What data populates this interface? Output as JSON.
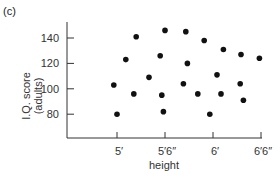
{
  "panel_label": "(c)",
  "chart_data": {
    "type": "scatter",
    "title": "",
    "xlabel": "height",
    "ylabel": "I.Q. score (adults)",
    "ylabel_lines": [
      "I.Q. score",
      "(adults)"
    ],
    "x_ticks": [
      {
        "label": "5′",
        "inches": 60
      },
      {
        "label": "5′6″",
        "inches": 66
      },
      {
        "label": "6′",
        "inches": 72
      },
      {
        "label": "6′6″",
        "inches": 78
      }
    ],
    "y_ticks": [
      80,
      100,
      120,
      140
    ],
    "xlim_inches": [
      53,
      79
    ],
    "ylim": [
      60,
      150
    ],
    "grid": false,
    "x_unit": "inches",
    "points": [
      {
        "x": 62.4,
        "y": 141
      },
      {
        "x": 66.0,
        "y": 146
      },
      {
        "x": 68.6,
        "y": 145
      },
      {
        "x": 70.9,
        "y": 138
      },
      {
        "x": 73.3,
        "y": 131
      },
      {
        "x": 75.5,
        "y": 127
      },
      {
        "x": 77.8,
        "y": 124
      },
      {
        "x": 61.1,
        "y": 123
      },
      {
        "x": 65.4,
        "y": 126
      },
      {
        "x": 68.8,
        "y": 120
      },
      {
        "x": 64.0,
        "y": 109
      },
      {
        "x": 72.5,
        "y": 111
      },
      {
        "x": 75.4,
        "y": 104
      },
      {
        "x": 59.6,
        "y": 103
      },
      {
        "x": 68.3,
        "y": 104
      },
      {
        "x": 62.1,
        "y": 96
      },
      {
        "x": 65.6,
        "y": 95
      },
      {
        "x": 70.1,
        "y": 96
      },
      {
        "x": 73.0,
        "y": 96
      },
      {
        "x": 75.8,
        "y": 91
      },
      {
        "x": 60.0,
        "y": 80
      },
      {
        "x": 65.8,
        "y": 82
      },
      {
        "x": 71.6,
        "y": 80
      }
    ]
  }
}
